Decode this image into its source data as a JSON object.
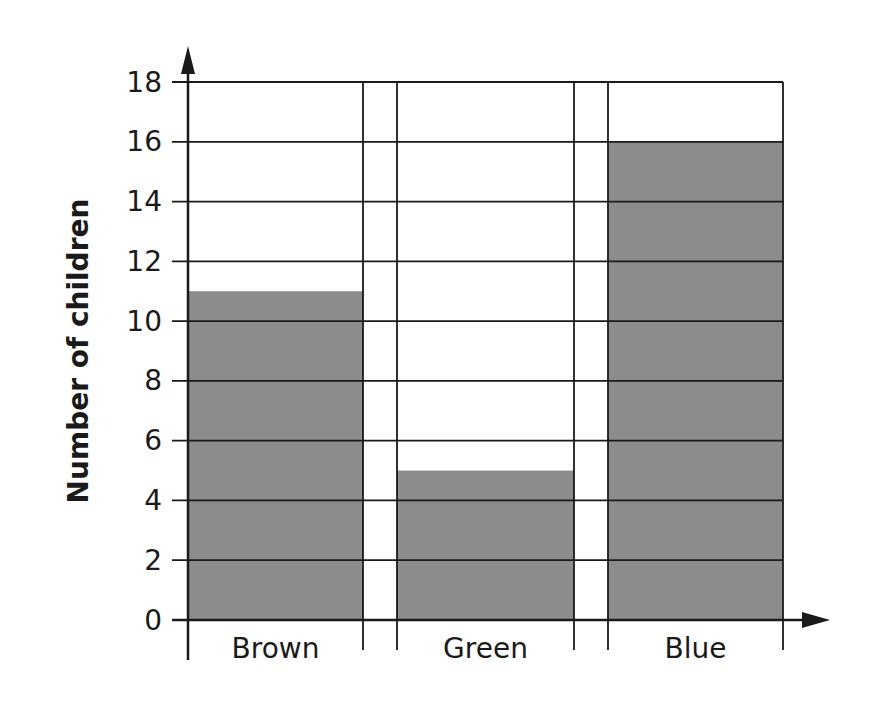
{
  "chart_data": {
    "type": "bar",
    "title": "",
    "xlabel": "",
    "ylabel": "Number of children",
    "categories": [
      "Brown",
      "Green",
      "Blue"
    ],
    "values": [
      11,
      5,
      16
    ],
    "ylim": [
      0,
      18
    ],
    "yticks": [
      0,
      2,
      4,
      6,
      8,
      10,
      12,
      14,
      16,
      18
    ],
    "grid": true,
    "legend": null,
    "bar_color": "#8c8c8c",
    "line_color": "#1a1a1a"
  }
}
